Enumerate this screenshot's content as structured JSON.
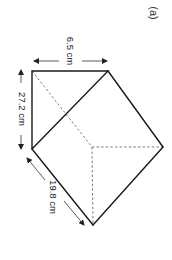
{
  "figure": {
    "label": "(a)",
    "shape": "triangular prism",
    "dimensions": {
      "top_width": "6.5 cm",
      "left_height": "27.2 cm",
      "slant_length": "19.8 cm"
    },
    "colors": {
      "edge": "#1a1a1a",
      "hidden_edge": "#555555",
      "background": "#ffffff"
    }
  }
}
